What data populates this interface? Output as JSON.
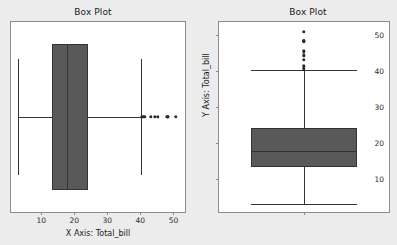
{
  "page": {
    "background_color": "#ececec",
    "width": 397,
    "height": 245
  },
  "panels": [
    {
      "id": "left",
      "title": "Box Plot",
      "orientation": "horizontal",
      "xlabel": "X Axis: Total_bill",
      "ylabel": "",
      "xticks": [
        "10",
        "20",
        "30",
        "40",
        "50"
      ],
      "yticks": []
    },
    {
      "id": "right",
      "title": "Box Plot",
      "orientation": "vertical",
      "xlabel": "",
      "ylabel": "Y Axis: Total_bill",
      "xticks": [],
      "yticks": [
        "10",
        "20",
        "30",
        "40",
        "50"
      ]
    }
  ],
  "style": {
    "box_fill": "#595959",
    "box_edge": "#333333",
    "flier_color": "#2b2b2b",
    "spine_color": "#8c8c8c",
    "axes_face": "#ffffff",
    "text_color": "#1a1a1a"
  },
  "chart_data": [
    {
      "type": "box",
      "title": "Box Plot",
      "orientation": "horizontal",
      "xlabel": "X Axis: Total_bill",
      "ylabel": "",
      "variable": "total_bill",
      "xlim": [
        0.87,
        53.5
      ],
      "xticks": [
        10,
        20,
        30,
        40,
        50
      ],
      "grid": false,
      "legend": null,
      "boxes": [
        {
          "label": "total_bill",
          "q1": 13.35,
          "median": 17.8,
          "q3": 24.13,
          "whisker_low": 3.07,
          "whisker_high": 40.17,
          "fliers": [
            40.55,
            41.19,
            43.11,
            44.3,
            45.35,
            48.17,
            48.27,
            48.33,
            50.81
          ]
        }
      ]
    },
    {
      "type": "box",
      "title": "Box Plot",
      "orientation": "vertical",
      "xlabel": "",
      "ylabel": "Y Axis: Total_bill",
      "variable": "total_bill",
      "ylim": [
        0.87,
        53.5
      ],
      "yticks": [
        10,
        20,
        30,
        40,
        50
      ],
      "grid": false,
      "legend": null,
      "boxes": [
        {
          "label": "total_bill",
          "q1": 13.35,
          "median": 17.8,
          "q3": 24.13,
          "whisker_low": 3.07,
          "whisker_high": 40.17,
          "fliers": [
            40.55,
            41.19,
            43.11,
            44.3,
            45.35,
            48.17,
            48.27,
            48.33,
            50.81
          ]
        }
      ]
    }
  ]
}
